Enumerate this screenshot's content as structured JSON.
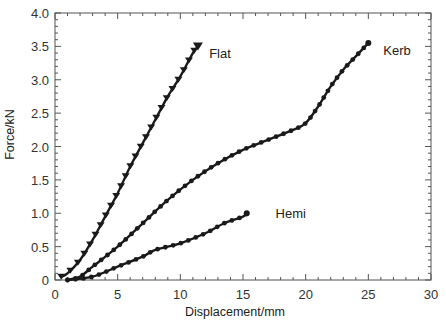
{
  "chart_data": {
    "type": "line",
    "title": "",
    "xlabel": "Displacement/mm",
    "ylabel": "Force/kN",
    "xlim": [
      0,
      30
    ],
    "ylim": [
      0,
      4.0
    ],
    "xticks": [
      0,
      5,
      10,
      15,
      20,
      25,
      30
    ],
    "xtick_labels": [
      "0",
      "5",
      "10",
      "15",
      "20",
      "25",
      "30"
    ],
    "yticks": [
      0,
      0.5,
      1.0,
      1.5,
      2.0,
      2.5,
      3.0,
      3.5,
      4.0
    ],
    "ytick_labels": [
      "0",
      "0.5",
      "1.0",
      "1.5",
      "2.0",
      "2.5",
      "3.0",
      "3.5",
      "4.0"
    ],
    "grid": false,
    "legend": "inline labels at curve ends",
    "series": [
      {
        "name": "Flat",
        "marker": "triangle-down",
        "x": [
          0.5,
          1,
          2,
          3,
          4,
          5,
          6,
          7,
          8,
          9,
          10,
          11,
          11.4
        ],
        "y": [
          0.05,
          0.1,
          0.3,
          0.6,
          0.95,
          1.3,
          1.7,
          2.05,
          2.4,
          2.75,
          3.05,
          3.4,
          3.5
        ],
        "label_pos": [
          12.3,
          3.4
        ]
      },
      {
        "name": "Kerb",
        "marker": "circle",
        "x": [
          1,
          2,
          3,
          5,
          7,
          9,
          11,
          13,
          15,
          17,
          19,
          20,
          21,
          22,
          23,
          24,
          25
        ],
        "y": [
          0,
          0.05,
          0.2,
          0.5,
          0.85,
          1.2,
          1.5,
          1.75,
          1.95,
          2.1,
          2.25,
          2.35,
          2.6,
          2.9,
          3.15,
          3.35,
          3.55
        ],
        "label_pos": [
          26.2,
          3.45
        ]
      },
      {
        "name": "Hemi",
        "marker": "circle",
        "x": [
          1,
          3,
          5,
          7,
          8,
          10,
          12,
          13.5,
          15,
          15.3
        ],
        "y": [
          0,
          0.05,
          0.2,
          0.35,
          0.45,
          0.55,
          0.7,
          0.85,
          0.95,
          1.0
        ],
        "label_pos": [
          17.6,
          1.0
        ]
      }
    ]
  },
  "plot": {
    "left": 55,
    "top": 13,
    "right": 431,
    "bottom": 280,
    "line_color": "#1a1a1a",
    "axis_color": "#555555"
  }
}
